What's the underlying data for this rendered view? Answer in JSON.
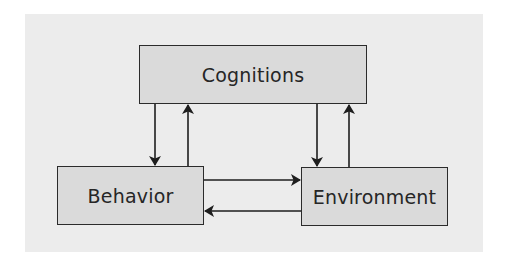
{
  "diagram": {
    "nodes": [
      {
        "id": "cognitions",
        "label": "Cognitions"
      },
      {
        "id": "behavior",
        "label": "Behavior"
      },
      {
        "id": "environment",
        "label": "Environment"
      }
    ],
    "edges": [
      {
        "from": "cognitions",
        "to": "behavior"
      },
      {
        "from": "behavior",
        "to": "cognitions"
      },
      {
        "from": "cognitions",
        "to": "environment"
      },
      {
        "from": "environment",
        "to": "cognitions"
      },
      {
        "from": "behavior",
        "to": "environment"
      },
      {
        "from": "environment",
        "to": "behavior"
      }
    ],
    "colors": {
      "panel_background": "#ececec",
      "node_fill": "#dadada",
      "node_border": "#2b2b2b",
      "arrow": "#1e1e1e",
      "text": "#262626"
    }
  }
}
